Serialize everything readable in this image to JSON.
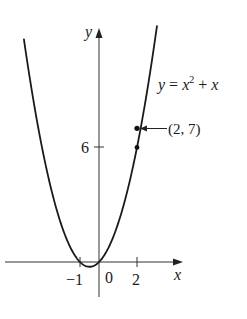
{
  "chart_data": {
    "type": "line",
    "title": "",
    "equation_label": "y = x² + x",
    "xlabel": "x",
    "ylabel": "y",
    "x_ticks": [
      {
        "value": -1,
        "label": "−1"
      },
      {
        "value": 0,
        "label": "0"
      },
      {
        "value": 2,
        "label": "2"
      }
    ],
    "y_ticks": [
      {
        "value": 6,
        "label": "6"
      }
    ],
    "series": [
      {
        "name": "y = x^2 + x",
        "function": "x^2 + x",
        "x_range": [
          -3.95,
          3.05
        ],
        "x": [
          -3.95,
          -3,
          -2,
          -1,
          -0.5,
          0,
          1,
          2,
          3,
          3.05
        ],
        "y": [
          11.65,
          6,
          2,
          0,
          -0.25,
          0,
          2,
          6,
          12,
          12.35
        ]
      }
    ],
    "points": [
      {
        "x": 2,
        "y": 7,
        "label": "(2, 7)",
        "annotated": true
      },
      {
        "x": 2,
        "y": 6,
        "label": "",
        "annotated": false
      }
    ],
    "annotations": [
      {
        "text": "(2, 7)",
        "arrow_to": [
          2,
          7
        ]
      },
      {
        "text": "y = x² + x",
        "position": "right of curve"
      }
    ],
    "grid": false,
    "legend": null
  },
  "labels": {
    "y_axis": "y",
    "x_axis": "x",
    "eq_y": "y",
    "eq_eq": " = ",
    "eq_x": "x",
    "eq_exp": "2",
    "eq_plus": " + ",
    "eq_x2": "x",
    "point_label": "(2, 7)",
    "tick_6": "6",
    "tick_neg1": "−1",
    "tick_0": "0",
    "tick_2": "2"
  },
  "colors": {
    "curve": "#1a1a1a",
    "axes": "#333333",
    "background": "#ffffff"
  }
}
